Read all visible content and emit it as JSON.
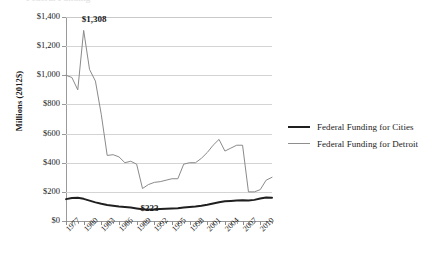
{
  "title_fragment": "Federal Funding",
  "axes": {
    "ylabel": "Millions (2012$)",
    "yticks": [
      "$0",
      "$200",
      "$400",
      "$600",
      "$800",
      "$1,000",
      "$1,200",
      "$1,400"
    ],
    "xticks": [
      "1977",
      "1980",
      "1983",
      "1986",
      "1989",
      "1992",
      "1995",
      "1998",
      "2001",
      "2004",
      "2007",
      "2010"
    ]
  },
  "legend": {
    "items": [
      {
        "label": "Federal Funding for Cities",
        "color": "#1f1f1f"
      },
      {
        "label": "Federal Funding for Detroit",
        "color": "#8e8e8e"
      }
    ]
  },
  "annotations": [
    {
      "text": "$1,308",
      "value": 1308,
      "year": 1979
    },
    {
      "text": "$223",
      "value": 223,
      "year": 1990
    }
  ],
  "chart_data": {
    "type": "line",
    "title": "Federal Funding",
    "xlabel": "",
    "ylabel": "Millions (2012$)",
    "xlim": [
      1977,
      2012
    ],
    "ylim": [
      0,
      1400
    ],
    "grid": true,
    "legend_position": "right",
    "x": [
      1977,
      1978,
      1979,
      1980,
      1981,
      1982,
      1983,
      1984,
      1985,
      1986,
      1987,
      1988,
      1989,
      1990,
      1991,
      1992,
      1993,
      1994,
      1995,
      1996,
      1997,
      1998,
      1999,
      2000,
      2001,
      2002,
      2003,
      2004,
      2005,
      2006,
      2007,
      2008,
      2009,
      2010,
      2011,
      2012
    ],
    "series": [
      {
        "name": "Federal Funding for Detroit",
        "color": "#8e8e8e",
        "values": [
          1000,
          985,
          900,
          1308,
          1040,
          960,
          730,
          450,
          455,
          440,
          400,
          410,
          390,
          223,
          250,
          265,
          270,
          280,
          290,
          290,
          390,
          400,
          400,
          430,
          470,
          520,
          560,
          480,
          500,
          520,
          520,
          200,
          200,
          215,
          280,
          300
        ]
      },
      {
        "name": "Federal Funding for Cities",
        "color": "#1f1f1f",
        "values": [
          150,
          158,
          160,
          152,
          140,
          128,
          118,
          110,
          105,
          100,
          96,
          92,
          86,
          80,
          79,
          80,
          82,
          84,
          86,
          88,
          92,
          96,
          100,
          105,
          112,
          120,
          128,
          135,
          138,
          140,
          142,
          140,
          145,
          155,
          162,
          160
        ]
      }
    ]
  }
}
